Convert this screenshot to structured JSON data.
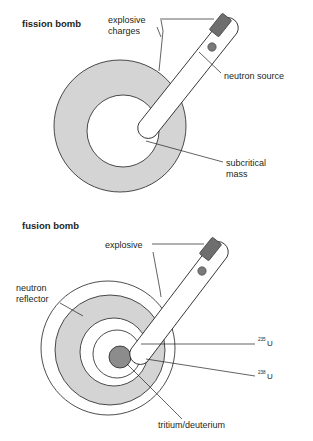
{
  "figure": {
    "background": "#ffffff",
    "ink": "#231f20",
    "gray_fill": "#d4d4d4",
    "core_fill": "#8c8c8c",
    "detonator_fill": "#6e6e6e"
  },
  "panels": [
    {
      "id": "fission",
      "title": "fission bomb",
      "labels": {
        "explosive_charges_line1": "explosive",
        "explosive_charges_line2": "charges",
        "neutron_source": "neutron source",
        "subcritical_line1": "subcritical",
        "subcritical_line2": "mass"
      }
    },
    {
      "id": "fusion",
      "title": "fusion bomb",
      "labels": {
        "explosive": "explosive",
        "neutron_reflector_line1": "neutron",
        "neutron_reflector_line2": "reflector",
        "u235_sup": "235",
        "u235_sym": "U",
        "u238_sup": "238",
        "u238_sym": "U",
        "tritium_deuterium": "tritium/deuterium"
      }
    }
  ]
}
